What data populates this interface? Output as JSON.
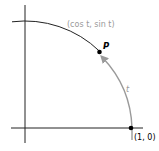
{
  "diagram": {
    "labels": {
      "point_p_coords": "(cos t, sin t)",
      "point_p": "P",
      "arc_length": "t",
      "start_point": "(1, 0)"
    },
    "colors": {
      "axis": "#222222",
      "circle": "#222222",
      "arc_highlight": "#9a9a9a",
      "coord_label": "#9a9a9a",
      "point": "#000000"
    }
  }
}
